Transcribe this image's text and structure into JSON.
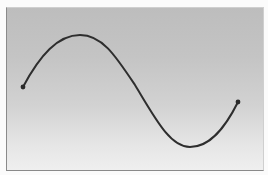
{
  "figure": {
    "colors": {
      "curve": "#2e2e2e",
      "point": "#2a2a2a",
      "gradient_top": "#bdbdbd",
      "gradient_bottom": "#efefef",
      "border_dark": "#8a8a8a",
      "border_light": "#cfcfcf"
    },
    "curve": {
      "start": {
        "x": 23,
        "y": 87
      },
      "peak": {
        "x": 80,
        "y": 35
      },
      "trough": {
        "x": 190,
        "y": 147
      },
      "end": {
        "x": 238,
        "y": 102
      }
    }
  }
}
